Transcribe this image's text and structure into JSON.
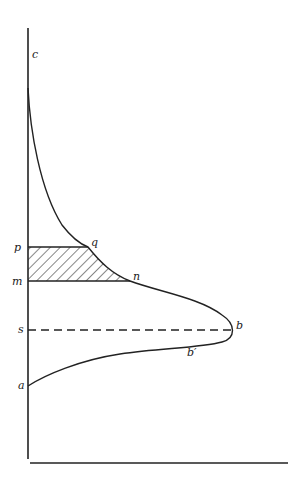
{
  "diagram": {
    "type": "curve-with-shaded-band",
    "labels": {
      "c": "c",
      "p": "p",
      "q": "q",
      "m": "m",
      "n": "n",
      "s": "s",
      "b": "b",
      "b_prime": "b′",
      "a": "a"
    },
    "colors": {
      "stroke": "#222222",
      "background": "#ffffff"
    }
  }
}
